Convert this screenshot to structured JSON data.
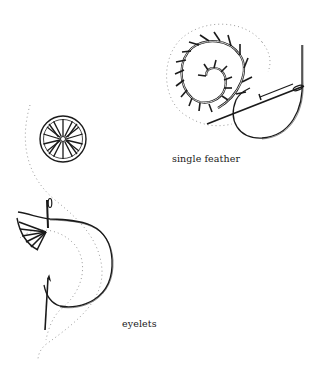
{
  "illustrations": [
    {
      "id": "single-feather",
      "caption": "single feather",
      "elements": [
        "spiral feather stitch",
        "needle",
        "thread loop",
        "dotted guide line"
      ]
    },
    {
      "id": "eyelets",
      "caption": "eyelets",
      "elements": [
        "round eyelet flower",
        "partial eyelet with needle",
        "thread loop",
        "dotted guide lines"
      ]
    }
  ],
  "colors": {
    "ink": "#1a1a1a",
    "dotted": "#9a9a9a",
    "background": "#ffffff"
  }
}
